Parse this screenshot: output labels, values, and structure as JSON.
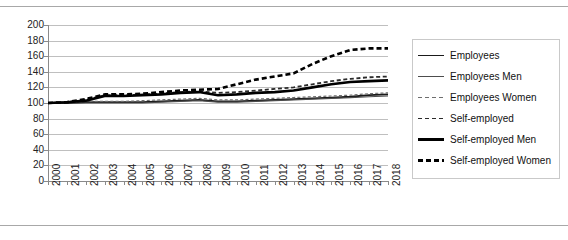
{
  "chart_data": {
    "type": "line",
    "title": "",
    "xlabel": "",
    "ylabel": "",
    "ylim": [
      0,
      200
    ],
    "ytick_step": 20,
    "grid": true,
    "legend_position": "right",
    "categories": [
      "2000",
      "2001",
      "2002",
      "2003",
      "2004",
      "2005",
      "2006",
      "2007",
      "2008",
      "2009",
      "2010",
      "2011",
      "2012",
      "2013",
      "2014",
      "2015",
      "2016",
      "2017",
      "2018"
    ],
    "yticks": [
      "0",
      "20",
      "40",
      "60",
      "80",
      "100",
      "120",
      "140",
      "160",
      "180",
      "200"
    ],
    "series": [
      {
        "name": "Employees",
        "style": "solid",
        "width": "medium",
        "color": "#1a1a1a",
        "values": [
          100,
          100,
          101,
          101,
          101,
          101,
          102,
          103,
          104,
          102,
          102,
          103,
          104,
          105,
          106,
          107,
          108,
          110,
          111
        ]
      },
      {
        "name": "Employees Men",
        "style": "solid",
        "width": "thin",
        "color": "#4d4d4d",
        "values": [
          100,
          100,
          100,
          100,
          100,
          100,
          101,
          102,
          103,
          101,
          101,
          102,
          103,
          104,
          105,
          106,
          107,
          108,
          109
        ]
      },
      {
        "name": "Employees Women",
        "style": "dashed",
        "width": "thin",
        "color": "#6e6e6e",
        "values": [
          100,
          101,
          102,
          102,
          102,
          103,
          104,
          105,
          106,
          104,
          104,
          105,
          106,
          107,
          108,
          109,
          110,
          112,
          113
        ]
      },
      {
        "name": "Self-employed",
        "style": "dashed",
        "width": "medium",
        "color": "#2b2b2b",
        "values": [
          100,
          101,
          104,
          110,
          110,
          111,
          112,
          114,
          115,
          113,
          114,
          116,
          118,
          120,
          124,
          128,
          131,
          133,
          134
        ]
      },
      {
        "name": "Self-employed Men",
        "style": "solid",
        "width": "thick",
        "color": "#000000",
        "values": [
          100,
          101,
          103,
          109,
          109,
          110,
          111,
          113,
          114,
          110,
          111,
          113,
          114,
          116,
          120,
          124,
          127,
          128,
          129
        ]
      },
      {
        "name": "Self-employed Women",
        "style": "dashed",
        "width": "thick",
        "color": "#000000",
        "values": [
          100,
          101,
          105,
          111,
          111,
          112,
          114,
          116,
          117,
          118,
          124,
          130,
          134,
          138,
          150,
          160,
          168,
          170,
          170
        ]
      }
    ]
  }
}
